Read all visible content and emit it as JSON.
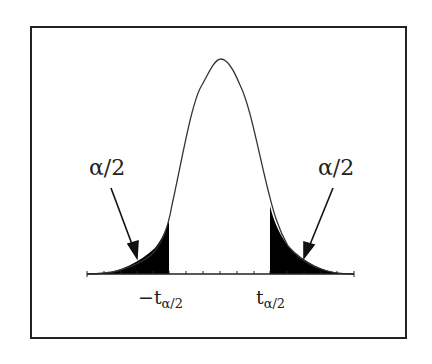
{
  "diagram": {
    "type": "t-distribution two-tailed rejection regions",
    "labels": {
      "left_tail": "α/2",
      "right_tail": "α/2",
      "left_critical_main": "−t",
      "left_critical_sub": "α/2",
      "right_critical_main": "t",
      "right_critical_sub": "α/2"
    },
    "colors": {
      "curve": "#333333",
      "shade": "#000000",
      "frame": "#222222"
    }
  }
}
